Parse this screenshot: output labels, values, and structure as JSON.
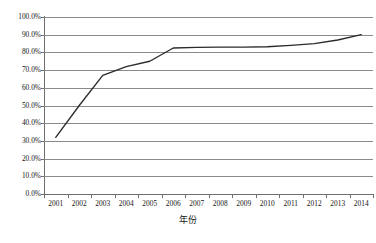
{
  "chart_data": {
    "type": "line",
    "title": "",
    "xlabel": "年份",
    "ylabel": "",
    "categories": [
      "2001",
      "2002",
      "2003",
      "2004",
      "2005",
      "2006",
      "2007",
      "2008",
      "2009",
      "2010",
      "2011",
      "2012",
      "2013",
      "2014"
    ],
    "series": [
      {
        "name": "",
        "values": [
          32.0,
          50.0,
          67.0,
          72.0,
          75.0,
          82.5,
          82.8,
          83.0,
          83.0,
          83.2,
          84.0,
          85.0,
          87.0,
          90.0
        ]
      }
    ],
    "ylim": [
      0,
      100
    ],
    "ytick_labels": [
      "100.0%",
      "90.0%",
      "80.0%",
      "70.0%",
      "60.0%",
      "50.0%",
      "40.0%",
      "30.0%",
      "20.0%",
      "10.0%",
      "0.0%"
    ],
    "ytick_values": [
      100,
      90,
      80,
      70,
      60,
      50,
      40,
      30,
      20,
      10,
      0
    ],
    "grid": true,
    "legend": false,
    "legend_position": "none",
    "line_color": "#2b2b2b",
    "grid_color": "#8a8a8a",
    "axis_color": "#6e6e6e",
    "background": "#ffffff"
  }
}
